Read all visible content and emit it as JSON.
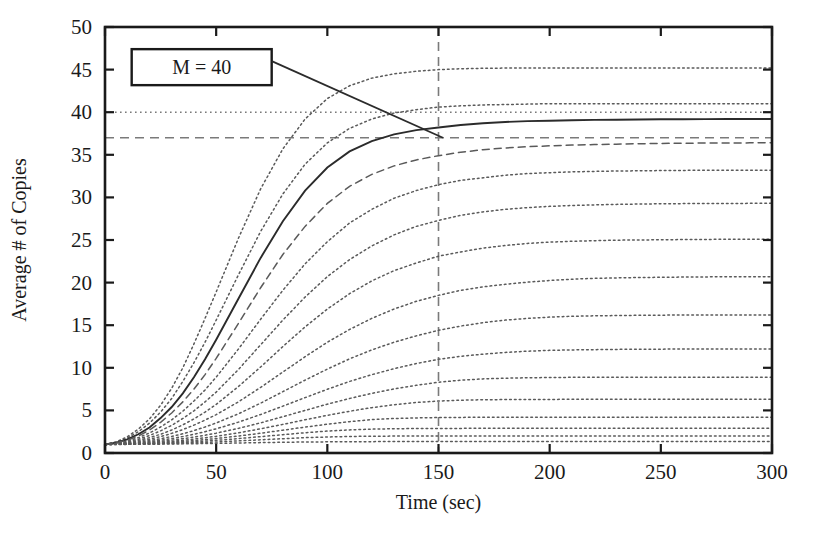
{
  "chart_data": {
    "type": "line",
    "title": "",
    "xlabel": "Time (sec)",
    "ylabel": "Average # of Copies",
    "xlim": [
      0,
      300
    ],
    "ylim": [
      0,
      50
    ],
    "xticks": [
      0,
      50,
      100,
      150,
      200,
      250,
      300
    ],
    "yticks": [
      0,
      5,
      10,
      15,
      20,
      25,
      30,
      35,
      40,
      45,
      50
    ],
    "grid": false,
    "legend": "none",
    "annotations": [
      {
        "name": "M = 40",
        "text": "M = 40",
        "boxed": true,
        "leader_from_x": 75,
        "leader_from_y": 46,
        "leader_to_x": 152,
        "leader_to_y": 37
      }
    ],
    "reference_lines": [
      {
        "name": "asymptote-M",
        "orientation": "horizontal",
        "value": 40,
        "style": "dotted"
      },
      {
        "name": "steady-state",
        "orientation": "horizontal",
        "value": 37,
        "style": "dashed"
      },
      {
        "name": "time-marker",
        "orientation": "vertical",
        "value": 150,
        "style": "dashed"
      }
    ],
    "x": [
      0,
      5,
      10,
      15,
      20,
      25,
      30,
      35,
      40,
      45,
      50,
      60,
      70,
      80,
      90,
      100,
      110,
      120,
      130,
      140,
      150,
      160,
      170,
      180,
      190,
      200,
      210,
      220,
      230,
      240,
      250,
      260,
      270,
      280,
      290,
      300
    ],
    "series": [
      {
        "name": "curve-1",
        "style": "dotted",
        "plateau": 45.2,
        "values": [
          1.0,
          1.3,
          1.9,
          2.8,
          4.0,
          5.6,
          7.6,
          10.0,
          12.8,
          15.8,
          18.9,
          25.2,
          31.0,
          35.7,
          39.2,
          41.6,
          43.1,
          44.0,
          44.5,
          44.8,
          45.0,
          45.1,
          45.15,
          45.18,
          45.19,
          45.2,
          45.2,
          45.2,
          45.2,
          45.2,
          45.2,
          45.2,
          45.2,
          45.2,
          45.2,
          45.2
        ]
      },
      {
        "name": "curve-2",
        "style": "dotted",
        "plateau": 41.0,
        "values": [
          1.0,
          1.25,
          1.75,
          2.5,
          3.5,
          4.8,
          6.4,
          8.4,
          10.6,
          13.0,
          15.6,
          20.9,
          26.0,
          30.4,
          33.9,
          36.4,
          38.1,
          39.2,
          39.9,
          40.3,
          40.6,
          40.75,
          40.85,
          40.9,
          40.95,
          41.0,
          41.0,
          41.0,
          41.0,
          41.0,
          41.0,
          41.0,
          41.0,
          41.0,
          41.0,
          41.0
        ]
      },
      {
        "name": "curve-3-highlighted",
        "style": "solid",
        "plateau": 39.2,
        "values": [
          1.0,
          1.2,
          1.6,
          2.2,
          3.0,
          4.1,
          5.4,
          7.0,
          8.9,
          11.0,
          13.3,
          18.1,
          22.9,
          27.2,
          30.8,
          33.5,
          35.4,
          36.6,
          37.4,
          37.9,
          38.2,
          38.5,
          38.7,
          38.85,
          38.95,
          39.0,
          39.05,
          39.1,
          39.12,
          39.15,
          39.17,
          39.18,
          39.19,
          39.2,
          39.2,
          39.2
        ]
      },
      {
        "name": "curve-4",
        "style": "dashed",
        "plateau": 36.4,
        "values": [
          1.0,
          1.18,
          1.5,
          2.0,
          2.7,
          3.6,
          4.7,
          6.0,
          7.5,
          9.2,
          11.1,
          15.2,
          19.4,
          23.3,
          26.6,
          29.3,
          31.3,
          32.7,
          33.7,
          34.4,
          34.9,
          35.3,
          35.6,
          35.8,
          35.95,
          36.05,
          36.15,
          36.2,
          36.25,
          36.3,
          36.33,
          36.36,
          36.38,
          36.39,
          36.4,
          36.4
        ]
      },
      {
        "name": "curve-5",
        "style": "dotted",
        "plateau": 33.2,
        "values": [
          1.0,
          1.15,
          1.4,
          1.8,
          2.35,
          3.05,
          3.9,
          4.9,
          6.1,
          7.4,
          8.9,
          12.2,
          15.7,
          19.1,
          22.2,
          24.8,
          27.0,
          28.6,
          29.9,
          30.8,
          31.5,
          32.0,
          32.3,
          32.6,
          32.8,
          32.9,
          33.0,
          33.05,
          33.1,
          33.12,
          33.15,
          33.17,
          33.18,
          33.19,
          33.2,
          33.2
        ]
      },
      {
        "name": "curve-6",
        "style": "dotted",
        "plateau": 29.3,
        "values": [
          1.0,
          1.12,
          1.32,
          1.62,
          2.05,
          2.6,
          3.25,
          4.05,
          4.95,
          6.0,
          7.15,
          9.8,
          12.7,
          15.6,
          18.3,
          20.7,
          22.7,
          24.3,
          25.6,
          26.6,
          27.3,
          27.9,
          28.3,
          28.6,
          28.8,
          28.95,
          29.05,
          29.12,
          29.18,
          29.22,
          29.25,
          29.27,
          29.28,
          29.29,
          29.3,
          29.3
        ]
      },
      {
        "name": "curve-7",
        "style": "dotted",
        "plateau": 25.1,
        "values": [
          1.0,
          1.1,
          1.25,
          1.48,
          1.8,
          2.2,
          2.7,
          3.3,
          4.0,
          4.8,
          5.7,
          7.8,
          10.1,
          12.5,
          14.8,
          16.9,
          18.7,
          20.2,
          21.4,
          22.3,
          23.1,
          23.6,
          24.05,
          24.35,
          24.6,
          24.75,
          24.85,
          24.92,
          24.98,
          25.0,
          25.03,
          25.05,
          25.07,
          25.08,
          25.1,
          25.1
        ]
      },
      {
        "name": "curve-8",
        "style": "dotted",
        "plateau": 20.7,
        "values": [
          1.0,
          1.08,
          1.2,
          1.38,
          1.62,
          1.92,
          2.3,
          2.75,
          3.27,
          3.86,
          4.5,
          6.0,
          7.7,
          9.5,
          11.3,
          13.0,
          14.5,
          15.8,
          16.9,
          17.8,
          18.5,
          19.1,
          19.5,
          19.8,
          20.05,
          20.25,
          20.4,
          20.5,
          20.55,
          20.6,
          20.62,
          20.65,
          20.67,
          20.68,
          20.7,
          20.7
        ]
      },
      {
        "name": "curve-9",
        "style": "dotted",
        "plateau": 16.2,
        "values": [
          1.0,
          1.06,
          1.15,
          1.28,
          1.45,
          1.67,
          1.94,
          2.26,
          2.63,
          3.05,
          3.52,
          4.6,
          5.85,
          7.2,
          8.55,
          9.85,
          11.05,
          12.1,
          13.0,
          13.75,
          14.4,
          14.9,
          15.3,
          15.6,
          15.8,
          15.95,
          16.05,
          16.1,
          16.13,
          16.16,
          16.18,
          16.19,
          16.2,
          16.2,
          16.2,
          16.2
        ]
      },
      {
        "name": "curve-10",
        "style": "dotted",
        "plateau": 12.2,
        "values": [
          1.0,
          1.05,
          1.12,
          1.21,
          1.34,
          1.5,
          1.7,
          1.93,
          2.2,
          2.5,
          2.84,
          3.62,
          4.52,
          5.5,
          6.5,
          7.48,
          8.4,
          9.2,
          9.9,
          10.5,
          11.0,
          11.35,
          11.6,
          11.8,
          11.95,
          12.05,
          12.1,
          12.13,
          12.16,
          12.18,
          12.19,
          12.2,
          12.2,
          12.2,
          12.2,
          12.2
        ]
      },
      {
        "name": "curve-11",
        "style": "dotted",
        "plateau": 8.9,
        "values": [
          1.0,
          1.04,
          1.09,
          1.16,
          1.25,
          1.37,
          1.51,
          1.68,
          1.87,
          2.09,
          2.33,
          2.89,
          3.54,
          4.26,
          5.0,
          5.73,
          6.4,
          7.0,
          7.52,
          7.95,
          8.3,
          8.55,
          8.7,
          8.78,
          8.83,
          8.86,
          8.88,
          8.89,
          8.9,
          8.9,
          8.9,
          8.9,
          8.9,
          8.9,
          8.9,
          8.9
        ]
      },
      {
        "name": "curve-12",
        "style": "dotted",
        "plateau": 6.3,
        "values": [
          1.0,
          1.03,
          1.07,
          1.12,
          1.19,
          1.27,
          1.37,
          1.49,
          1.63,
          1.79,
          1.96,
          2.37,
          2.84,
          3.36,
          3.9,
          4.42,
          4.9,
          5.32,
          5.67,
          5.93,
          6.1,
          6.2,
          6.25,
          6.27,
          6.28,
          6.29,
          6.3,
          6.3,
          6.3,
          6.3,
          6.3,
          6.3,
          6.3,
          6.3,
          6.3,
          6.3
        ]
      },
      {
        "name": "curve-13",
        "style": "dotted",
        "plateau": 4.2,
        "values": [
          1.0,
          1.02,
          1.05,
          1.09,
          1.14,
          1.2,
          1.27,
          1.36,
          1.46,
          1.57,
          1.7,
          1.99,
          2.32,
          2.68,
          3.04,
          3.38,
          3.68,
          3.92,
          4.05,
          4.12,
          4.16,
          4.18,
          4.19,
          4.2,
          4.2,
          4.2,
          4.2,
          4.2,
          4.2,
          4.2,
          4.2,
          4.2,
          4.2,
          4.2,
          4.2,
          4.2
        ]
      },
      {
        "name": "curve-14",
        "style": "dotted",
        "plateau": 2.9,
        "values": [
          1.0,
          1.015,
          1.035,
          1.06,
          1.095,
          1.14,
          1.19,
          1.25,
          1.32,
          1.4,
          1.49,
          1.69,
          1.92,
          2.15,
          2.38,
          2.57,
          2.71,
          2.8,
          2.85,
          2.87,
          2.88,
          2.89,
          2.9,
          2.9,
          2.9,
          2.9,
          2.9,
          2.9,
          2.9,
          2.9,
          2.9,
          2.9,
          2.9,
          2.9,
          2.9,
          2.9
        ]
      },
      {
        "name": "curve-15",
        "style": "dotted",
        "plateau": 2.0,
        "values": [
          1.0,
          1.01,
          1.022,
          1.04,
          1.062,
          1.09,
          1.122,
          1.16,
          1.2,
          1.25,
          1.3,
          1.42,
          1.55,
          1.68,
          1.8,
          1.88,
          1.94,
          1.97,
          1.985,
          1.99,
          1.995,
          2.0,
          2.0,
          2.0,
          2.0,
          2.0,
          2.0,
          2.0,
          2.0,
          2.0,
          2.0,
          2.0,
          2.0,
          2.0,
          2.0,
          2.0
        ]
      },
      {
        "name": "curve-16",
        "style": "dotted",
        "plateau": 1.35,
        "values": [
          1.0,
          1.005,
          1.012,
          1.02,
          1.03,
          1.042,
          1.056,
          1.072,
          1.09,
          1.11,
          1.13,
          1.175,
          1.22,
          1.26,
          1.29,
          1.31,
          1.325,
          1.335,
          1.34,
          1.345,
          1.35,
          1.35,
          1.35,
          1.35,
          1.35,
          1.35,
          1.35,
          1.35,
          1.35,
          1.35,
          1.35,
          1.35,
          1.35,
          1.35,
          1.35,
          1.35
        ]
      }
    ]
  },
  "axes": {
    "x_title": "Time (sec)",
    "y_title": "Average # of Copies",
    "x_tick_labels": [
      "0",
      "50",
      "100",
      "150",
      "200",
      "250",
      "300"
    ],
    "y_tick_labels": [
      "0",
      "5",
      "10",
      "15",
      "20",
      "25",
      "30",
      "35",
      "40",
      "45",
      "50"
    ]
  },
  "annotation_box": {
    "label": "M = 40"
  },
  "colors": {
    "axis": "#1a1a1a",
    "curve": "#5a5a5a",
    "highlight": "#2b2b2b",
    "reference": "#7a7a7a",
    "background": "#ffffff"
  }
}
